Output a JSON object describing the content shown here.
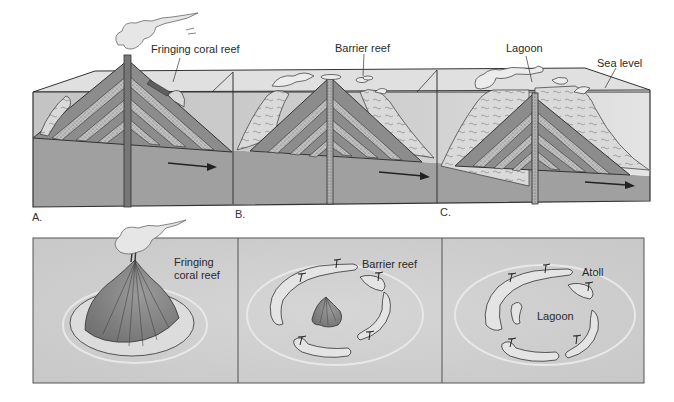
{
  "figure": {
    "colors": {
      "water": "#c9c9c9",
      "water_light": "#dcdcdc",
      "sea_surface": "#e2e2e2",
      "seafloor": "#9a9a9a",
      "volcano_dark": "#8a8a8a",
      "volcano_stipple": "#bdbdbd",
      "reef": "#d8d8d8",
      "outline": "#333333",
      "panel_bg": "#cfcfcf"
    }
  },
  "cross_sections": {
    "panels": [
      {
        "letter": "A.",
        "labels": [
          "Fringing coral reef"
        ]
      },
      {
        "letter": "B.",
        "labels": [
          "Barrier reef"
        ]
      },
      {
        "letter": "C.",
        "labels": [
          "Lagoon",
          "Sea level"
        ]
      }
    ],
    "arrow_meaning": "subsidence / plate motion direction"
  },
  "plan_views": {
    "panels": [
      {
        "labels": [
          "Fringing",
          "coral reef"
        ]
      },
      {
        "labels": [
          "Barrier reef"
        ]
      },
      {
        "labels": [
          "Atoll",
          "Lagoon"
        ]
      }
    ]
  }
}
